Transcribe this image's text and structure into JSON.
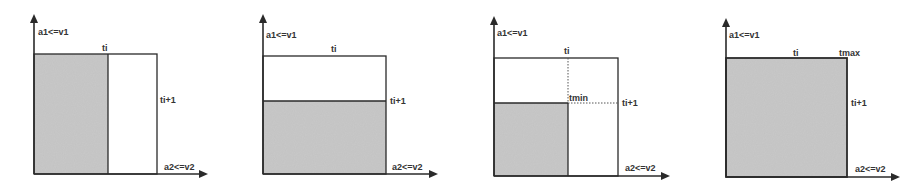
{
  "colors": {
    "line": "#2a2a2a",
    "shade": "#c8c8c8",
    "background": "#ffffff",
    "dotted": "#555555"
  },
  "panels": [
    {
      "id": "panel-1",
      "y_axis_label": "a1<=v1",
      "x_axis_label": "a2<=v2",
      "top_label": "ti",
      "right_label": "ti+1",
      "shaded_region": "left column up to ti"
    },
    {
      "id": "panel-2",
      "y_axis_label": "a1<=v1",
      "x_axis_label": "a2<=v2",
      "top_label": "ti",
      "right_label": "ti+1",
      "shaded_region": "bottom band up to ti+1"
    },
    {
      "id": "panel-3",
      "y_axis_label": "a1<=v1",
      "x_axis_label": "a2<=v2",
      "top_label": "ti",
      "right_label": "ti+1",
      "corner_label": "tmin",
      "shaded_region": "bottom-left square bounded by ti and ti+1"
    },
    {
      "id": "panel-4",
      "y_axis_label": "a1<=v1",
      "x_axis_label": "a2<=v2",
      "top_label": "ti",
      "right_label": "ti+1",
      "corner_label": "tmax",
      "shaded_region": "entire rectangle"
    }
  ]
}
